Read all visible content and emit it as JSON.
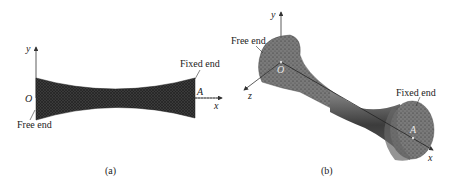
{
  "panels": [
    {
      "id": "a",
      "caption": "(a)",
      "view": "2D side view of hyperboloid-like beam",
      "axes": {
        "y": "y",
        "x": "x",
        "origin": "O",
        "point_a": "A"
      },
      "annotations": {
        "free_end": "Free end",
        "fixed_end": "Fixed end"
      }
    },
    {
      "id": "b",
      "caption": "(b)",
      "view": "3D isometric view of hyperboloid-like beam",
      "axes": {
        "y": "y",
        "x": "x",
        "z": "z",
        "origin": "O",
        "point_a": "A"
      },
      "annotations": {
        "free_end": "Free end",
        "fixed_end": "Fixed end"
      }
    }
  ],
  "colors": {
    "mesh_dark": "#2a2a2a",
    "mesh_mid": "#6b6b6b",
    "mesh_light": "#8c8c8c",
    "axis": "#333333"
  }
}
